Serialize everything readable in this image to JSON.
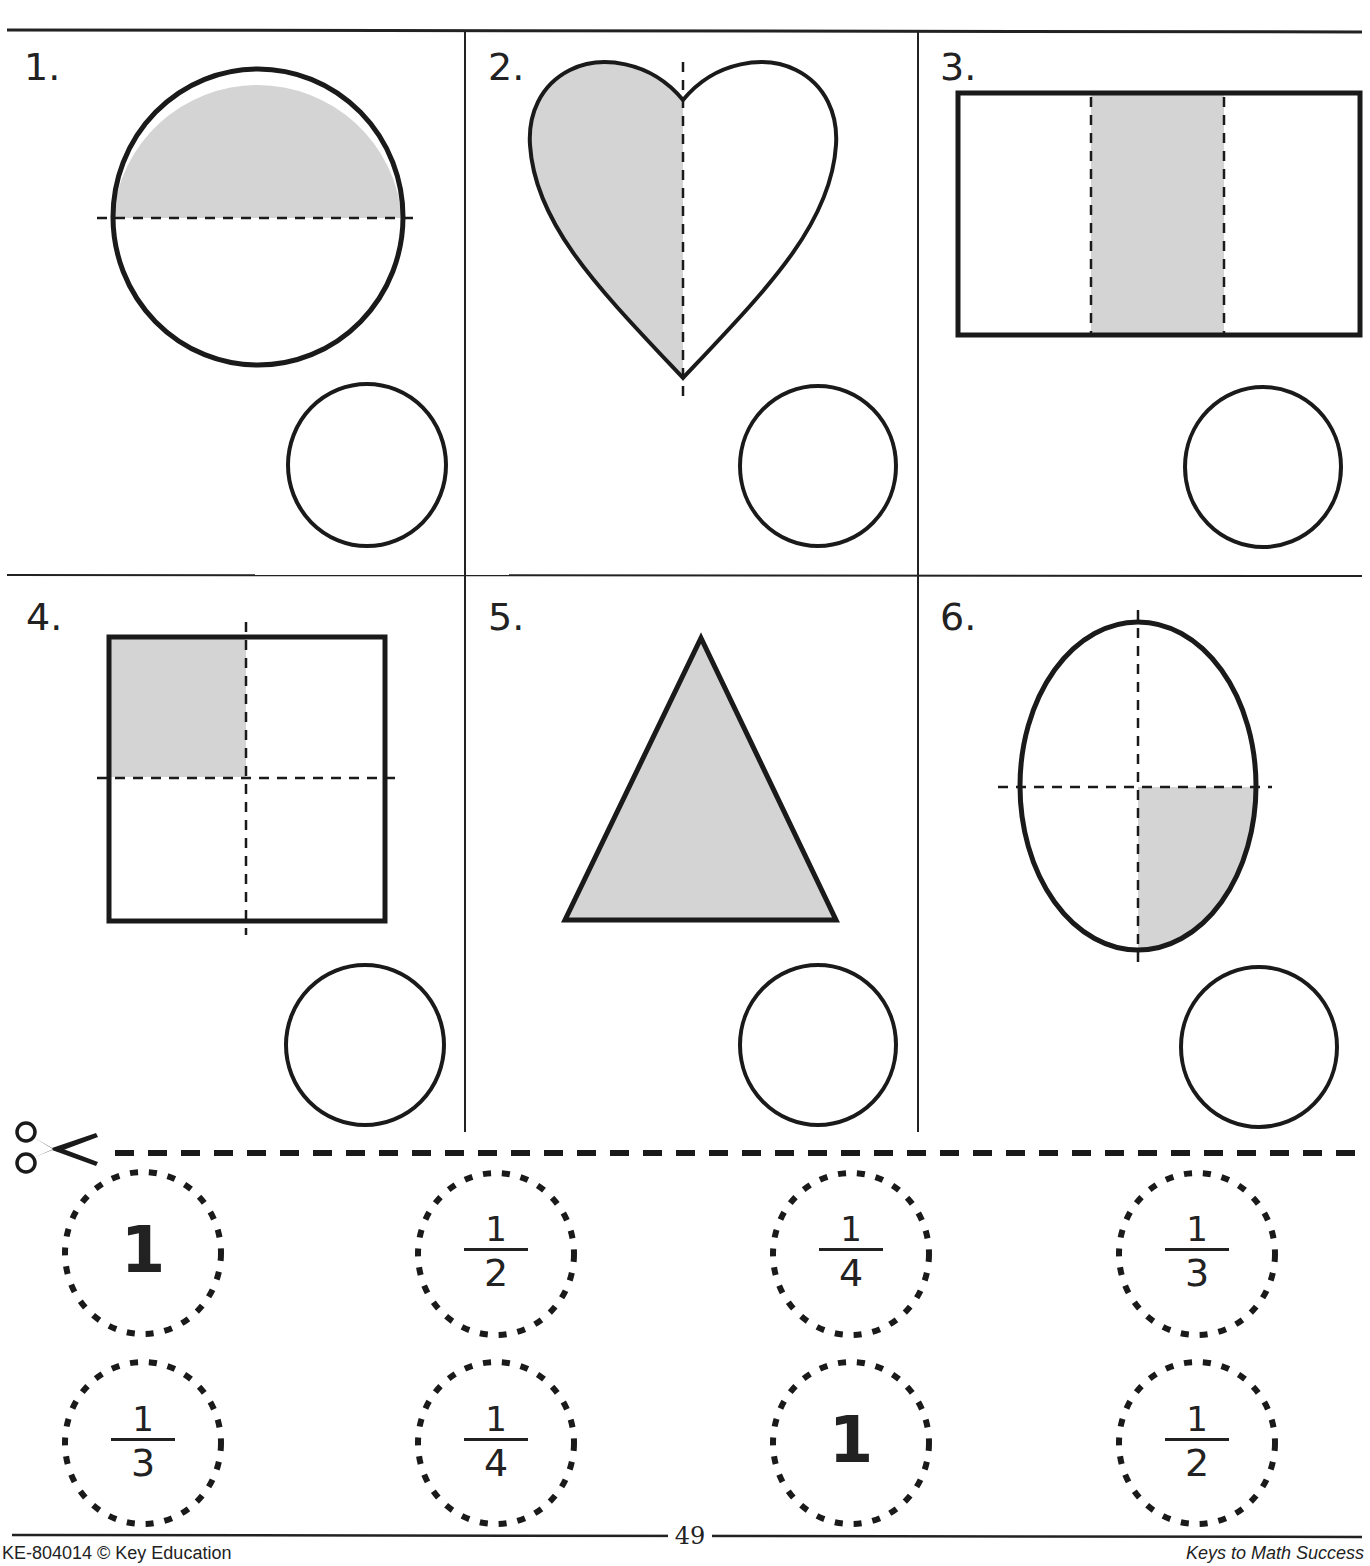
{
  "worksheet": {
    "problems": [
      {
        "number": "1.",
        "shape": "circle",
        "divisions": 2,
        "shaded": 1,
        "fraction_shown": "1/2"
      },
      {
        "number": "2.",
        "shape": "heart",
        "divisions": 2,
        "shaded": 1,
        "fraction_shown": "1/2"
      },
      {
        "number": "3.",
        "shape": "rectangle",
        "divisions": 3,
        "shaded": 1,
        "fraction_shown": "1/3"
      },
      {
        "number": "4.",
        "shape": "square",
        "divisions": 4,
        "shaded": 1,
        "fraction_shown": "1/4"
      },
      {
        "number": "5.",
        "shape": "triangle",
        "divisions": 1,
        "shaded": 1,
        "fraction_shown": "1"
      },
      {
        "number": "6.",
        "shape": "oval",
        "divisions": 4,
        "shaded": 1,
        "fraction_shown": "1/4"
      }
    ],
    "answer_circle_label": "answer-circle"
  },
  "cutouts": {
    "row1": [
      {
        "type": "whole",
        "value": "1"
      },
      {
        "type": "fraction",
        "numerator": "1",
        "denominator": "2"
      },
      {
        "type": "fraction",
        "numerator": "1",
        "denominator": "4"
      },
      {
        "type": "fraction",
        "numerator": "1",
        "denominator": "3"
      }
    ],
    "row2": [
      {
        "type": "fraction",
        "numerator": "1",
        "denominator": "3"
      },
      {
        "type": "fraction",
        "numerator": "1",
        "denominator": "4"
      },
      {
        "type": "whole",
        "value": "1"
      },
      {
        "type": "fraction",
        "numerator": "1",
        "denominator": "2"
      }
    ],
    "cut_icon": "scissors-icon"
  },
  "footer": {
    "left": "KE-804014 © Key Education",
    "page_number": "49",
    "right": "Keys to Math Success"
  },
  "colors": {
    "ink": "#1a1a1a",
    "shade": "#d4d4d4",
    "paper": "#ffffff"
  }
}
